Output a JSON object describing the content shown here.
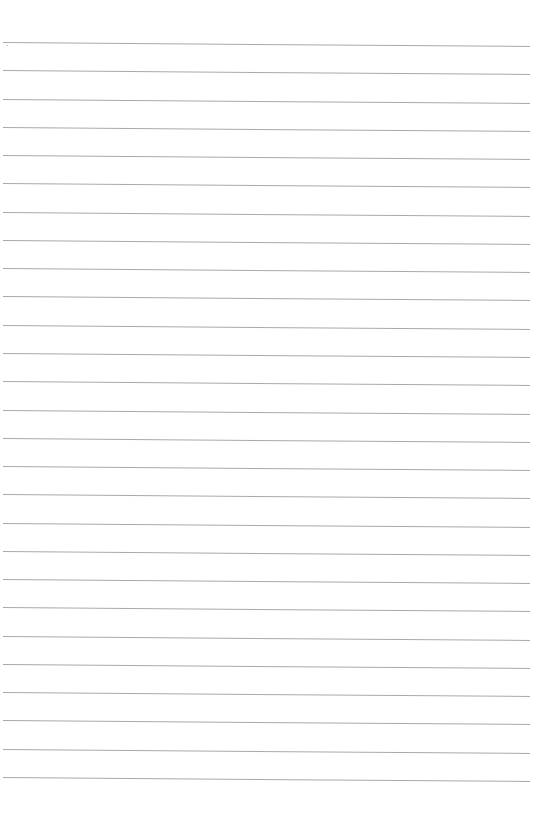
{
  "page": {
    "type": "blank lined paper",
    "background": "#ffffff",
    "line_color": "#9a9a9a",
    "line_count": 27,
    "first_line_y": 42,
    "line_spacing": 28.27
  }
}
